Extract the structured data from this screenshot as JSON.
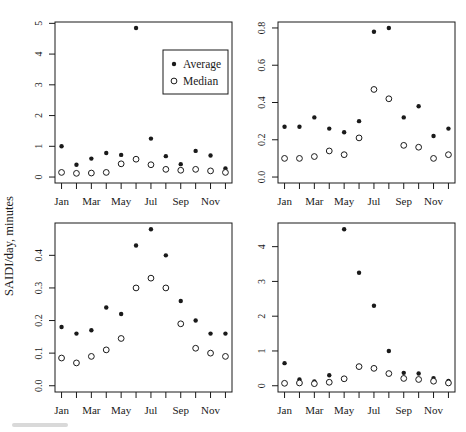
{
  "figure": {
    "ylabel": "SAIDI/day, minutes",
    "colors": {
      "foreground": "#1a1a1a",
      "background": "#ffffff"
    },
    "legend": {
      "position": "inside-top-right-of-first-panel",
      "items": [
        {
          "label": "Average",
          "marker": "filled-circle"
        },
        {
          "label": "Median",
          "marker": "open-circle"
        }
      ]
    }
  },
  "chart_data": [
    {
      "type": "scatter",
      "position": "top-left",
      "title": "",
      "xlabel": "",
      "ylabel": "",
      "grid": false,
      "x_categories": [
        "Jan",
        "Feb",
        "Mar",
        "Apr",
        "May",
        "Jun",
        "Jul",
        "Aug",
        "Sep",
        "Oct",
        "Nov",
        "Dec"
      ],
      "x_ticklabels_shown": [
        "Jan",
        "Mar",
        "May",
        "Jul",
        "Sep",
        "Nov"
      ],
      "ylim": [
        0,
        4.85
      ],
      "yticks": [
        0,
        1,
        2,
        3,
        4,
        5
      ],
      "ytick_labels": [
        "0",
        "1",
        "2",
        "3",
        "4",
        "5"
      ],
      "has_legend": true,
      "series": [
        {
          "name": "Average",
          "marker": "filled-circle",
          "values": [
            1.0,
            0.4,
            0.6,
            0.78,
            0.72,
            4.85,
            1.25,
            0.68,
            0.42,
            0.85,
            0.7,
            0.28
          ]
        },
        {
          "name": "Median",
          "marker": "open-circle",
          "values": [
            0.15,
            0.12,
            0.13,
            0.15,
            0.43,
            0.58,
            0.4,
            0.25,
            0.22,
            0.25,
            0.2,
            0.15
          ]
        }
      ]
    },
    {
      "type": "scatter",
      "position": "top-right",
      "title": "",
      "xlabel": "",
      "ylabel": "",
      "grid": false,
      "x_categories": [
        "Jan",
        "Feb",
        "Mar",
        "Apr",
        "May",
        "Jun",
        "Jul",
        "Aug",
        "Sep",
        "Oct",
        "Nov",
        "Dec"
      ],
      "x_ticklabels_shown": [
        "Jan",
        "Mar",
        "May",
        "Jul",
        "Sep",
        "Nov"
      ],
      "ylim": [
        0,
        0.8
      ],
      "yticks": [
        0,
        0.2,
        0.4,
        0.6,
        0.8
      ],
      "ytick_labels": [
        "0.0",
        "0.2",
        "0.4",
        "0.6",
        "0.8"
      ],
      "has_legend": false,
      "series": [
        {
          "name": "Average",
          "marker": "filled-circle",
          "values": [
            0.27,
            0.27,
            0.32,
            0.26,
            0.24,
            0.3,
            0.78,
            0.8,
            0.32,
            0.38,
            0.22,
            0.26
          ]
        },
        {
          "name": "Median",
          "marker": "open-circle",
          "values": [
            0.1,
            0.1,
            0.11,
            0.14,
            0.12,
            0.21,
            0.47,
            0.42,
            0.17,
            0.16,
            0.1,
            0.12
          ]
        }
      ]
    },
    {
      "type": "scatter",
      "position": "bottom-left",
      "title": "",
      "xlabel": "",
      "ylabel": "",
      "grid": false,
      "x_categories": [
        "Jan",
        "Feb",
        "Mar",
        "Apr",
        "May",
        "Jun",
        "Jul",
        "Aug",
        "Sep",
        "Oct",
        "Nov",
        "Dec"
      ],
      "x_ticklabels_shown": [
        "Jan",
        "Mar",
        "May",
        "Jul",
        "Sep",
        "Nov"
      ],
      "ylim": [
        0,
        0.48
      ],
      "yticks": [
        0,
        0.1,
        0.2,
        0.3,
        0.4
      ],
      "ytick_labels": [
        "0.0",
        "0.1",
        "0.2",
        "0.3",
        "0.4"
      ],
      "has_legend": false,
      "series": [
        {
          "name": "Average",
          "marker": "filled-circle",
          "values": [
            0.18,
            0.16,
            0.17,
            0.24,
            0.22,
            0.43,
            0.48,
            0.4,
            0.26,
            0.2,
            0.16,
            0.16
          ]
        },
        {
          "name": "Median",
          "marker": "open-circle",
          "values": [
            0.085,
            0.07,
            0.09,
            0.11,
            0.145,
            0.3,
            0.33,
            0.3,
            0.19,
            0.115,
            0.1,
            0.09
          ]
        }
      ]
    },
    {
      "type": "scatter",
      "position": "bottom-right",
      "title": "",
      "xlabel": "",
      "ylabel": "",
      "grid": false,
      "x_categories": [
        "Jan",
        "Feb",
        "Mar",
        "Apr",
        "May",
        "Jun",
        "Jul",
        "Aug",
        "Sep",
        "Oct",
        "Nov",
        "Dec"
      ],
      "x_ticklabels_shown": [
        "Jan",
        "Mar",
        "May",
        "Jul",
        "Sep",
        "Nov"
      ],
      "ylim": [
        0,
        4.5
      ],
      "yticks": [
        0,
        1,
        2,
        3,
        4
      ],
      "ytick_labels": [
        "0",
        "1",
        "2",
        "3",
        "4"
      ],
      "has_legend": false,
      "series": [
        {
          "name": "Average",
          "marker": "filled-circle",
          "values": [
            0.65,
            0.18,
            0.12,
            0.3,
            4.5,
            3.25,
            2.3,
            1.0,
            0.37,
            0.35,
            0.22,
            0.14
          ]
        },
        {
          "name": "Median",
          "marker": "open-circle",
          "values": [
            0.07,
            0.08,
            0.06,
            0.1,
            0.2,
            0.55,
            0.5,
            0.35,
            0.21,
            0.18,
            0.13,
            0.08
          ]
        }
      ]
    }
  ]
}
